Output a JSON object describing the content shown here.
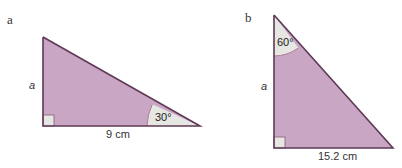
{
  "colors": {
    "fill": "#c9a6c4",
    "stroke": "#5e3a55",
    "angle_fill": "#e6e6e2",
    "arc": "#b07a98"
  },
  "diagram_a": {
    "part_label": "a",
    "side_label": "a",
    "base_label": "9 cm",
    "angle_label": "30°",
    "vertices": {
      "top": [
        43,
        37
      ],
      "right_angle": [
        43,
        126
      ],
      "acute": [
        200,
        126
      ]
    }
  },
  "diagram_b": {
    "part_label": "b",
    "side_label": "a",
    "base_label": "15.2 cm",
    "angle_label": "60°",
    "vertices": {
      "top": [
        274,
        15
      ],
      "right_angle": [
        274,
        148
      ],
      "acute": [
        393,
        148
      ]
    }
  }
}
